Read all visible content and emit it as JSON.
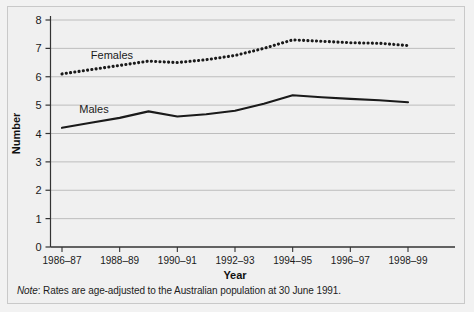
{
  "figure": {
    "background_color": "#f0f0f0",
    "frame_color": "#c9c9c9"
  },
  "note": {
    "lead": "Note",
    "text": ": Rates are age-adjusted to the Australian population at 30 June 1991."
  },
  "chart_data": {
    "type": "line",
    "title": "",
    "xlabel": "Year",
    "ylabel": "Number",
    "ylim": [
      0,
      8
    ],
    "yticks": [
      0,
      1,
      2,
      3,
      4,
      5,
      6,
      7,
      8
    ],
    "ytick_labels": [
      "0",
      "1",
      "2",
      "3",
      "4",
      "5",
      "6",
      "7",
      "8"
    ],
    "grid": true,
    "grid_color": "#b0b0b0",
    "legend_position": "inline-labels",
    "x": [
      "1986-87",
      "1987-88",
      "1988-89",
      "1989-90",
      "1990-91",
      "1991-92",
      "1992-93",
      "1993-94",
      "1994-95",
      "1995-96",
      "1996-97",
      "1997-98",
      "1998-99"
    ],
    "xtick_labels": [
      "1986–87",
      "1988–89",
      "1990–91",
      "1992–93",
      "1994–95",
      "1996–97",
      "1998–99"
    ],
    "xtick_positions": [
      0,
      2,
      4,
      6,
      8,
      10,
      12
    ],
    "series": [
      {
        "name": "Females",
        "style": "dotted",
        "color": "#1a1a1a",
        "label_x": 1.0,
        "label_y": 6.75,
        "values": [
          6.1,
          6.25,
          6.4,
          6.55,
          6.5,
          6.6,
          6.75,
          7.0,
          7.3,
          7.25,
          7.2,
          7.18,
          7.1
        ]
      },
      {
        "name": "Males",
        "style": "solid",
        "color": "#1a1a1a",
        "label_x": 0.6,
        "label_y": 4.85,
        "values": [
          4.2,
          4.38,
          4.55,
          4.78,
          4.6,
          4.68,
          4.8,
          5.05,
          5.35,
          5.28,
          5.22,
          5.17,
          5.1
        ]
      }
    ]
  }
}
